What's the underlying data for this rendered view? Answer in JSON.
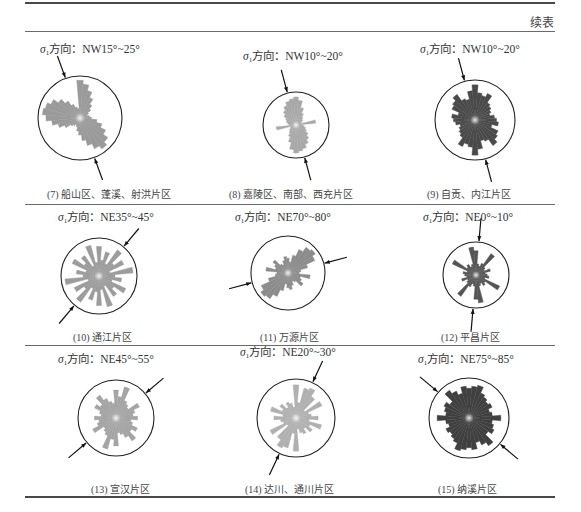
{
  "table": {
    "continuation_label": "续表",
    "sigma_prefix": "σ",
    "sigma_sub": "1",
    "direction_label": "方向：",
    "rows": [
      {
        "panels": [
          {
            "id": "7",
            "direction": "NW15°~25°",
            "caption": "(7) 船山区、蓬溪、射洪片区",
            "fill": "#9a9a9a",
            "title_x": 40,
            "title_y": 40,
            "cx": 80,
            "cy": 118,
            "r": 42,
            "caption_x": 47,
            "caption_y": 186,
            "arrow_angle": -20,
            "petals": [
              40,
              36,
              30,
              24,
              18,
              14,
              10,
              8,
              10,
              12,
              18,
              24,
              30,
              36,
              40,
              36,
              30,
              24,
              18,
              14,
              10,
              8,
              10,
              12,
              18,
              24,
              30,
              36,
              40,
              38,
              34,
              28,
              22,
              16,
              12,
              10
            ],
            "petal_scale": 0.9
          },
          {
            "id": "8",
            "direction": "NW10°~20°",
            "caption": "(8) 嘉陵区、南部、西充片区",
            "fill": "#a8a8a8",
            "title_x": 243,
            "title_y": 47,
            "cx": 296,
            "cy": 125,
            "r": 33,
            "caption_x": 229,
            "caption_y": 186,
            "arrow_angle": -15,
            "petals": [
              34,
              30,
              22,
              16,
              12,
              10,
              8,
              6,
              24,
              8,
              10,
              12,
              14,
              18,
              22,
              26,
              30,
              32,
              34,
              30,
              22,
              16,
              12,
              10,
              8,
              6,
              24,
              8,
              10,
              12,
              14,
              18,
              22,
              26,
              30,
              32
            ],
            "petal_scale": 0.85
          },
          {
            "id": "9",
            "direction": "NW10°~20°",
            "caption": "(9) 自贡、内江片区",
            "fill": "#4a4a4a",
            "title_x": 420,
            "title_y": 40,
            "cx": 475,
            "cy": 120,
            "r": 40,
            "caption_x": 427,
            "caption_y": 186,
            "arrow_angle": -15,
            "petals": [
              36,
              28,
              26,
              30,
              22,
              20,
              18,
              16,
              20,
              22,
              24,
              18,
              26,
              28,
              32,
              24,
              22,
              30,
              36,
              28,
              26,
              30,
              22,
              20,
              18,
              16,
              20,
              22,
              24,
              18,
              26,
              28,
              32,
              24,
              22,
              30
            ],
            "petal_scale": 0.88
          }
        ]
      },
      {
        "panels": [
          {
            "id": "10",
            "direction": "NE35°~45°",
            "caption": "(10) 通江片区",
            "fill": "#9c9c9c",
            "title_x": 58,
            "title_y": 208,
            "cx": 99,
            "cy": 276,
            "r": 38,
            "caption_x": 73,
            "caption_y": 329,
            "arrow_angle": 40,
            "petals": [
              26,
              14,
              22,
              12,
              28,
              16,
              24,
              10,
              30,
              14,
              20,
              12,
              26,
              16,
              22,
              10,
              28,
              12,
              26,
              14,
              22,
              12,
              28,
              16,
              24,
              10,
              30,
              14,
              20,
              12,
              26,
              16,
              22,
              10,
              28,
              12
            ],
            "petal_scale": 0.9
          },
          {
            "id": "11",
            "direction": "NE70°~80°",
            "caption": "(11) 万源片区",
            "fill": "#8c8c8c",
            "title_x": 235,
            "title_y": 208,
            "cx": 288,
            "cy": 273,
            "r": 37,
            "caption_x": 260,
            "caption_y": 329,
            "arrow_angle": 75,
            "petals": [
              16,
              12,
              20,
              28,
              34,
              36,
              32,
              22,
              14,
              12,
              24,
              14,
              16,
              20,
              12,
              10,
              14,
              18,
              16,
              12,
              20,
              28,
              34,
              36,
              32,
              22,
              14,
              12,
              24,
              14,
              16,
              20,
              12,
              10,
              14,
              18
            ],
            "petal_scale": 0.9
          },
          {
            "id": "12",
            "direction": "NE0°~10°",
            "caption": "(12) 平昌片区",
            "fill": "#555555",
            "title_x": 423,
            "title_y": 208,
            "cx": 476,
            "cy": 275,
            "r": 33,
            "caption_x": 441,
            "caption_y": 329,
            "arrow_angle": 5,
            "petals": [
              26,
              12,
              10,
              14,
              28,
              12,
              10,
              16,
              10,
              12,
              14,
              10,
              28,
              12,
              14,
              10,
              12,
              30,
              26,
              12,
              10,
              14,
              28,
              12,
              10,
              16,
              10,
              12,
              14,
              10,
              28,
              12,
              14,
              10,
              12,
              30
            ],
            "petal_scale": 0.85
          }
        ]
      },
      {
        "panels": [
          {
            "id": "13",
            "direction": "NE45°~55°",
            "caption": "(13) 宣汉片区",
            "fill": "#a4a4a4",
            "title_x": 58,
            "title_y": 350,
            "cx": 116,
            "cy": 418,
            "r": 38,
            "caption_x": 91,
            "caption_y": 481,
            "arrow_angle": 50,
            "petals": [
              26,
              20,
              30,
              18,
              16,
              14,
              24,
              18,
              16,
              20,
              14,
              16,
              22,
              18,
              26,
              20,
              16,
              14,
              26,
              20,
              30,
              18,
              16,
              14,
              24,
              18,
              16,
              20,
              14,
              16,
              22,
              18,
              26,
              20,
              16,
              14
            ],
            "petal_scale": 0.85
          },
          {
            "id": "14",
            "direction": "NE20°~30°",
            "caption": "(14) 达川、通川片区",
            "fill": "#b0b0b0",
            "title_x": 240,
            "title_y": 343,
            "cx": 296,
            "cy": 418,
            "r": 39,
            "caption_x": 245,
            "caption_y": 481,
            "arrow_angle": 25,
            "petals": [
              30,
              14,
              28,
              30,
              24,
              10,
              26,
              12,
              14,
              20,
              12,
              24,
              14,
              18,
              12,
              16,
              14,
              10,
              30,
              14,
              28,
              30,
              24,
              10,
              26,
              12,
              14,
              20,
              12,
              24,
              14,
              18,
              12,
              16,
              14,
              10
            ],
            "petal_scale": 0.85
          },
          {
            "id": "15",
            "direction": "NE75°~85°",
            "caption": "(15) 纳溪片区",
            "fill": "#404040",
            "title_x": 418,
            "title_y": 350,
            "cx": 469,
            "cy": 418,
            "r": 40,
            "caption_x": 438,
            "caption_y": 481,
            "arrow_angle": -50,
            "petals": [
              28,
              30,
              32,
              26,
              24,
              22,
              24,
              20,
              22,
              30,
              22,
              24,
              26,
              22,
              32,
              28,
              24,
              30,
              28,
              30,
              32,
              26,
              24,
              22,
              24,
              20,
              22,
              30,
              22,
              24,
              26,
              22,
              32,
              28,
              24,
              30
            ],
            "petal_scale": 0.85
          }
        ]
      }
    ]
  }
}
